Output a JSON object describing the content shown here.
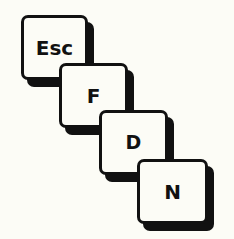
{
  "keys": [
    {
      "label": "Esc",
      "x": 21,
      "y": 15,
      "w": 67,
      "h": 65,
      "font_size": 20
    },
    {
      "label": "F",
      "x": 59,
      "y": 63,
      "w": 69,
      "h": 65,
      "font_size": 20
    },
    {
      "label": "D",
      "x": 99,
      "y": 110,
      "w": 69,
      "h": 65,
      "font_size": 19
    },
    {
      "label": "N",
      "x": 137,
      "y": 159,
      "w": 71,
      "h": 65,
      "font_size": 20
    }
  ],
  "colors": {
    "background": "#fcfcf6",
    "ink": "#111111"
  }
}
